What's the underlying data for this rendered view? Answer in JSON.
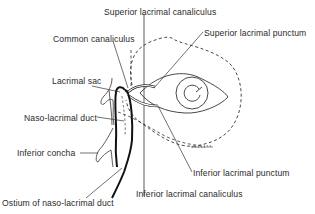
{
  "figure": {
    "labels": {
      "superior_lacrimal_canaliculus": "Superior lacrimal canaliculus",
      "common_canaliculus": "Common canaliculus",
      "superior_lacrimal_punctum": "Superior lacrimal punctum",
      "lacrimal_sac": "Lacrimal sac",
      "naso_lacrimal_duct": "Naso-lacrimal duct",
      "inferior_concha": "Inferior concha",
      "inferior_lacrimal_punctum": "Inferior lacrimal punctum",
      "ostium_of_naso_lacrimal_duct": "Ostium of naso-lacrimal duct",
      "inferior_lacrimal_canaliculus": "Inferior lacrimal canaliculus"
    }
  },
  "colors": {
    "ink": "#2a2a2a",
    "background": "#ffffff",
    "ghost_text": "#ececec"
  }
}
